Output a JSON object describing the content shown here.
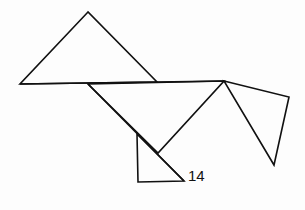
{
  "figure": {
    "label": "14",
    "stroke_color": "#111111",
    "shapes": [
      {
        "name": "top-triangle",
        "points": "88,12 20,84 157,82"
      },
      {
        "name": "middle-triangle",
        "points": "88,84 224,81 158,153"
      },
      {
        "name": "small-triangle",
        "points": "137,134 138,182 184,181"
      },
      {
        "name": "right-triangle",
        "points": "224,81 289,97 274,165"
      }
    ],
    "lines": [
      {
        "name": "baseline",
        "x1": 20,
        "y1": 84,
        "x2": 224,
        "y2": 81
      },
      {
        "name": "diagonal",
        "x1": 88,
        "y1": 84,
        "x2": 184,
        "y2": 181
      }
    ]
  }
}
